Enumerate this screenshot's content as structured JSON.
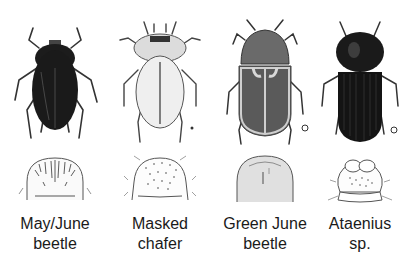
{
  "figure": {
    "species": [
      {
        "id": "may-june-beetle",
        "label_line1": "May/June",
        "label_line2": "beetle",
        "body_color": "#1c1c1c",
        "raster_style": "dense-bristles-with-septula"
      },
      {
        "id": "masked-chafer",
        "label_line1": "Masked",
        "label_line2": "chafer",
        "body_color": "#e6e6e6",
        "raster_style": "scattered-bristles"
      },
      {
        "id": "green-june-beetle",
        "label_line1": "Green June",
        "label_line2": "beetle",
        "body_color": "#5a5a5a",
        "raster_style": "smooth-dome"
      },
      {
        "id": "ataenius",
        "label_line1": "Ataenius",
        "label_line2": "sp.",
        "body_color": "#141414",
        "raster_style": "paired-pads"
      }
    ]
  }
}
